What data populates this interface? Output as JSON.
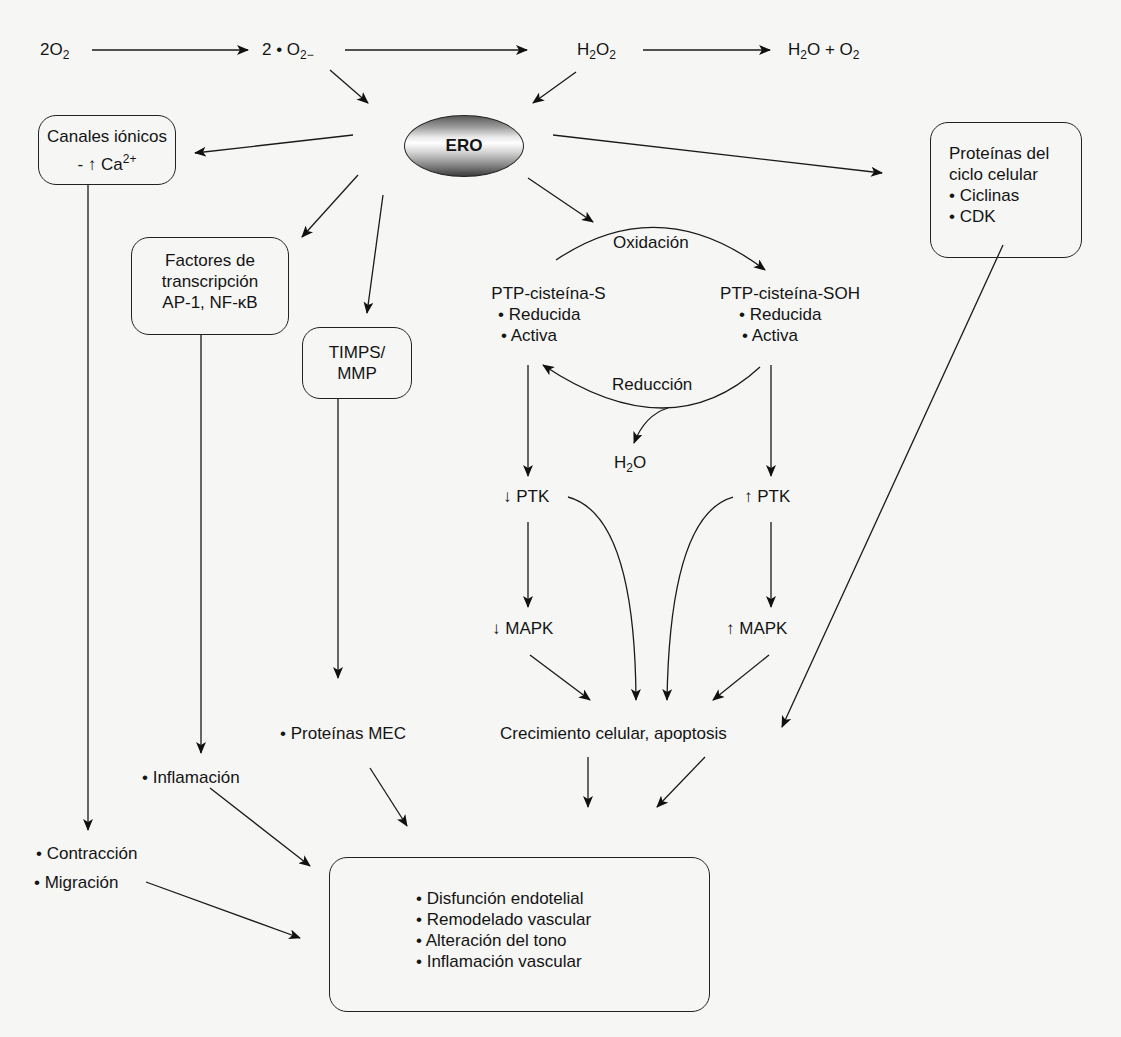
{
  "reactions": {
    "o2": "2O",
    "o2_sub": "2",
    "superoxide": "2 • O",
    "superoxide_sub": "2−",
    "h2o2": "H",
    "h2o2_sub1": "2",
    "h2o2_mid": "O",
    "h2o2_sub2": "2",
    "products_h": "H",
    "products_sub1": "2",
    "products_mid": "O + O",
    "products_sub2": "2"
  },
  "center_node": {
    "label": "ERO"
  },
  "boxes": {
    "ion_channels": {
      "title": "Canales iónicos",
      "line2": "- ↑ Ca",
      "line2_sup": "2+"
    },
    "transcription": {
      "line1": "Factores de",
      "line2": "transcripción",
      "line3": "AP-1, NF-κB"
    },
    "timps": {
      "line1": "TIMPS/",
      "line2": "MMP"
    },
    "cell_cycle": {
      "line1": "Proteínas del",
      "line2": "ciclo celular",
      "item1": "• Ciclinas",
      "item2": "• CDK"
    },
    "outcome": {
      "items": [
        "• Disfunción endotelial",
        "• Remodelado vascular",
        "• Alteración del tono",
        "• Inflamación vascular"
      ]
    }
  },
  "redox_cycle": {
    "oxidation": "Oxidación",
    "reduction": "Reducción",
    "reduced_form": {
      "title": "PTP-cisteína-S",
      "item1": "• Reducida",
      "item2": "• Activa"
    },
    "oxidized_form": {
      "title": "PTP-cisteína-SOH",
      "item1": "• Reducida",
      "item2": "• Activa"
    },
    "water": "H",
    "water_sub": "2",
    "water_end": "O"
  },
  "kinases": {
    "ptk_down": "↓ PTK",
    "ptk_up": "↑ PTK",
    "mapk_down": "↓ MAPK",
    "mapk_up": "↑ MAPK"
  },
  "effects": {
    "growth": "Crecimiento celular, apoptosis",
    "mec": "• Proteínas MEC",
    "inflammation": "• Inflamación",
    "contraction": "• Contracción",
    "migration": "• Migración"
  }
}
